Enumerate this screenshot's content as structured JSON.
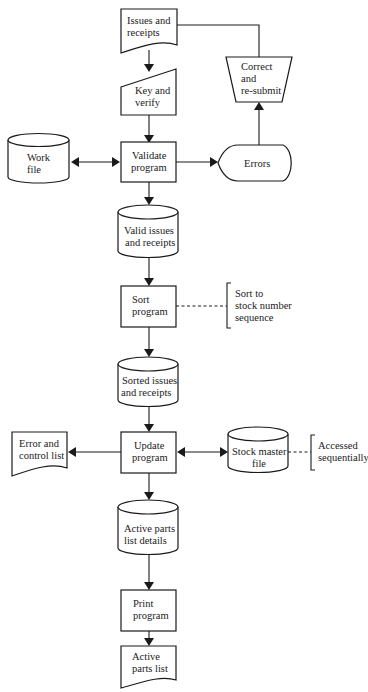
{
  "diagram": {
    "type": "system flowchart",
    "nodes": {
      "issues_receipts": {
        "shape": "document",
        "lines": [
          "Issues and",
          "receipts"
        ]
      },
      "key_verify": {
        "shape": "manual-input",
        "lines": [
          "Key and",
          "verify"
        ]
      },
      "correct_resubmit": {
        "shape": "manual-operation",
        "lines": [
          "Correct",
          "and",
          "re-submit"
        ]
      },
      "work_file": {
        "shape": "disk-storage",
        "lines": [
          "Work",
          "file"
        ]
      },
      "validate_program": {
        "shape": "process",
        "lines": [
          "Validate",
          "program"
        ]
      },
      "errors": {
        "shape": "display",
        "lines": [
          "Errors"
        ]
      },
      "valid_issues": {
        "shape": "disk-storage",
        "lines": [
          "Valid issues",
          "and receipts"
        ]
      },
      "sort_program": {
        "shape": "process",
        "lines": [
          "Sort",
          "program"
        ]
      },
      "sort_note": {
        "shape": "annotation",
        "lines": [
          "Sort to",
          "stock number",
          "sequence"
        ]
      },
      "sorted_issues": {
        "shape": "disk-storage",
        "lines": [
          "Sorted issues",
          "and receipts"
        ]
      },
      "error_control_list": {
        "shape": "document",
        "lines": [
          "Error and",
          "control list"
        ]
      },
      "update_program": {
        "shape": "process",
        "lines": [
          "Update",
          "program"
        ]
      },
      "stock_master": {
        "shape": "disk-storage",
        "lines": [
          "Stock master",
          "file"
        ]
      },
      "access_note": {
        "shape": "annotation",
        "lines": [
          "Accessed",
          "sequentially"
        ]
      },
      "active_details": {
        "shape": "disk-storage",
        "lines": [
          "Active parts",
          "list details"
        ]
      },
      "print_program": {
        "shape": "process",
        "lines": [
          "Print",
          "program"
        ]
      },
      "active_parts_list": {
        "shape": "document",
        "lines": [
          "Active",
          "parts list"
        ]
      }
    },
    "edges": [
      {
        "from": "issues_receipts",
        "to": "key_verify",
        "style": "arrow"
      },
      {
        "from": "key_verify",
        "to": "validate_program",
        "style": "arrow"
      },
      {
        "from": "work_file",
        "to": "validate_program",
        "style": "double-arrow"
      },
      {
        "from": "validate_program",
        "to": "errors",
        "style": "arrow"
      },
      {
        "from": "errors",
        "to": "correct_resubmit",
        "style": "arrow"
      },
      {
        "from": "correct_resubmit",
        "to": "issues_receipts",
        "style": "line"
      },
      {
        "from": "validate_program",
        "to": "valid_issues",
        "style": "arrow"
      },
      {
        "from": "valid_issues",
        "to": "sort_program",
        "style": "arrow"
      },
      {
        "from": "sort_program",
        "to": "sort_note",
        "style": "dashed"
      },
      {
        "from": "sort_program",
        "to": "sorted_issues",
        "style": "arrow"
      },
      {
        "from": "sorted_issues",
        "to": "update_program",
        "style": "arrow"
      },
      {
        "from": "update_program",
        "to": "error_control_list",
        "style": "arrow"
      },
      {
        "from": "update_program",
        "to": "stock_master",
        "style": "double-arrow"
      },
      {
        "from": "stock_master",
        "to": "access_note",
        "style": "dashed"
      },
      {
        "from": "update_program",
        "to": "active_details",
        "style": "arrow"
      },
      {
        "from": "active_details",
        "to": "print_program",
        "style": "arrow"
      },
      {
        "from": "print_program",
        "to": "active_parts_list",
        "style": "arrow"
      }
    ]
  }
}
